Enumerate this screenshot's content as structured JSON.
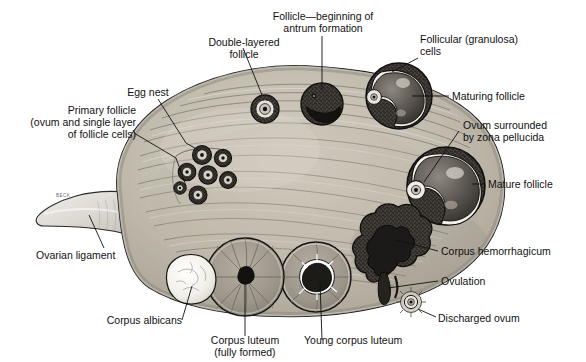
{
  "figure": {
    "artist_signature": "BECK",
    "palette": {
      "background": "#ffffff",
      "stroke": "#1a1a1a",
      "cortex_light": "#cfc9bd",
      "cortex_mid": "#b3ada0",
      "medulla": "#a9a296",
      "ligament": "#dedbd4",
      "follicle_dark": "#2e2b28",
      "granulosa": "#3a3632",
      "antrum": "#6b6660",
      "corpus_luteum": "#9a958a",
      "corpus_albicans": "#f2f0ea",
      "hemorrhagicum": "#24211e",
      "text": "#111111"
    }
  },
  "labels": [
    {
      "id": "double-layered-follicle",
      "text": "Double-layered\nfollicle",
      "align": "center"
    },
    {
      "id": "antrum-formation",
      "text": "Follicle—beginning of\nantrum formation",
      "align": "center"
    },
    {
      "id": "granulosa-cells",
      "text": "Follicular (granulosa)\ncells",
      "align": "left"
    },
    {
      "id": "maturing-follicle",
      "text": "Maturing follicle",
      "align": "left"
    },
    {
      "id": "zona-pellucida",
      "text": "Ovum surrounded\nby zona pellucida",
      "align": "left"
    },
    {
      "id": "mature-follicle",
      "text": "Mature follicle",
      "align": "left"
    },
    {
      "id": "corpus-hemorrhagicum",
      "text": "Corpus hemorrhagicum",
      "align": "left"
    },
    {
      "id": "ovulation",
      "text": "Ovulation",
      "align": "left"
    },
    {
      "id": "discharged-ovum",
      "text": "Discharged ovum",
      "align": "left"
    },
    {
      "id": "young-corpus-luteum",
      "text": "Young corpus luteum",
      "align": "left"
    },
    {
      "id": "corpus-luteum",
      "text": "Corpus luteum\n(fully formed)",
      "align": "center"
    },
    {
      "id": "corpus-albicans",
      "text": "Corpus albicans",
      "align": "right"
    },
    {
      "id": "ovarian-ligament",
      "text": "Ovarian ligament",
      "align": "left"
    },
    {
      "id": "primary-follicle",
      "text": "Primary follicle\n(ovum and single layer\nof follicle cells)",
      "align": "right"
    },
    {
      "id": "egg-nest",
      "text": "Egg nest",
      "align": "center"
    }
  ],
  "structures": [
    {
      "id": "ovary-body",
      "name": "Ovary cortex and medulla"
    },
    {
      "id": "ovarian-ligament",
      "name": "Ovarian ligament stalk"
    },
    {
      "id": "egg-nest-cluster",
      "name": "Cluster of primordial / primary follicles",
      "count": 7
    },
    {
      "id": "double-layered",
      "name": "Double-layered follicle"
    },
    {
      "id": "antrum-follicle",
      "name": "Follicle with beginning antrum"
    },
    {
      "id": "maturing-follicle",
      "name": "Maturing follicle"
    },
    {
      "id": "mature-follicle",
      "name": "Mature (Graafian) follicle"
    },
    {
      "id": "corpus-hemorrhagicum",
      "name": "Corpus hemorrhagicum"
    },
    {
      "id": "young-corpus-luteum",
      "name": "Young corpus luteum"
    },
    {
      "id": "corpus-luteum",
      "name": "Corpus luteum (fully formed)"
    },
    {
      "id": "corpus-albicans",
      "name": "Corpus albicans"
    },
    {
      "id": "discharged-ovum",
      "name": "Discharged ovum"
    }
  ]
}
